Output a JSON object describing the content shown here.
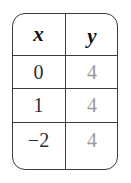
{
  "figure": {
    "kind": "function-value-table",
    "background_color": "#ffffff",
    "border_color": "#3b3b3b",
    "x_value_color": "#2e2e2e",
    "y_value_color": "#9a9a9a",
    "header_color": "#111111"
  },
  "chart_data": {
    "type": "table",
    "title": "",
    "xlabel": "",
    "ylabel": "",
    "columns": [
      "x",
      "y"
    ],
    "x": [
      0,
      1,
      -2
    ],
    "values": [
      4,
      4,
      4
    ],
    "series": [
      {
        "name": "y",
        "values": [
          4,
          4,
          4
        ]
      }
    ],
    "rows": [
      {
        "x": "0",
        "y": "4"
      },
      {
        "x": "1",
        "y": "4"
      },
      {
        "x": "−2",
        "y": "4"
      }
    ]
  },
  "table": {
    "headers": {
      "x": "x",
      "y": "y"
    },
    "rows": [
      {
        "x": "0",
        "y": "4"
      },
      {
        "x": "1",
        "y": "4"
      },
      {
        "x": "−2",
        "y": "4"
      }
    ]
  }
}
